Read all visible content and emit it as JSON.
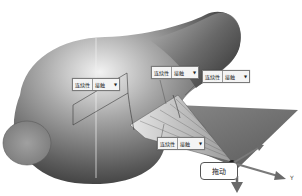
{
  "scene": {
    "description": "3D CAD surface fill with continuity handles",
    "colors": {
      "surface_light": "#d8d8d8",
      "surface_dark": "#3a3a3a",
      "plane": "#6e6e6e",
      "arrow": "#6a6a6a"
    }
  },
  "handles": [
    {
      "label": "连续性",
      "value": "接触",
      "x": 72,
      "y": 78
    },
    {
      "label": "连续性",
      "value": "接触",
      "x": 151,
      "y": 66
    },
    {
      "label": "连续性",
      "value": "接触",
      "x": 202,
      "y": 70
    },
    {
      "label": "连续性",
      "value": "接触",
      "x": 157,
      "y": 137
    }
  ],
  "callout": {
    "text": "拖动"
  },
  "axes": {
    "y_label": "Y"
  }
}
